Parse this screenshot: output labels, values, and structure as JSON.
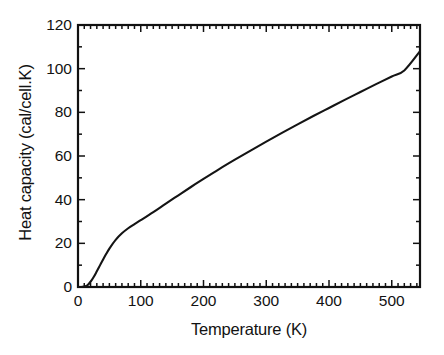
{
  "figure": {
    "background": "#ffffff",
    "frame_color": "#111111",
    "curve_color": "#141414"
  },
  "chart_data": {
    "type": "line",
    "title": "",
    "xlabel": "Temperature (K)",
    "ylabel": "Heat capacity (cal/cell.K)",
    "xlim": [
      0,
      545
    ],
    "ylim": [
      0,
      120
    ],
    "grid": false,
    "legend": null,
    "xticks": [
      0,
      100,
      200,
      300,
      400,
      500
    ],
    "xtick_labels": [
      "0",
      "100",
      "200",
      "300",
      "400",
      "500"
    ],
    "xminor_step": 10,
    "yticks": [
      0,
      20,
      40,
      60,
      80,
      100,
      120
    ],
    "ytick_labels": [
      "0",
      "20",
      "40",
      "60",
      "80",
      "100",
      "120"
    ],
    "yminor_step": 10,
    "tick_direction": "in",
    "series": [
      {
        "name": "Heat capacity",
        "x": [
          0,
          5,
          10,
          15,
          20,
          25,
          30,
          35,
          40,
          45,
          50,
          60,
          70,
          80,
          90,
          100,
          120,
          140,
          160,
          180,
          200,
          225,
          250,
          275,
          300,
          325,
          350,
          375,
          400,
          425,
          450,
          475,
          500,
          520,
          545
        ],
        "y": [
          0,
          0,
          0.2,
          0.8,
          2.4,
          4.6,
          7.2,
          9.9,
          12.6,
          15.2,
          17.6,
          21.6,
          24.6,
          26.9,
          28.8,
          30.6,
          34.3,
          38.2,
          42.0,
          45.8,
          49.5,
          54.0,
          58.3,
          62.5,
          66.6,
          70.6,
          74.5,
          78.3,
          82.0,
          85.7,
          89.3,
          92.9,
          96.4,
          99.2,
          108.0
        ]
      }
    ]
  }
}
